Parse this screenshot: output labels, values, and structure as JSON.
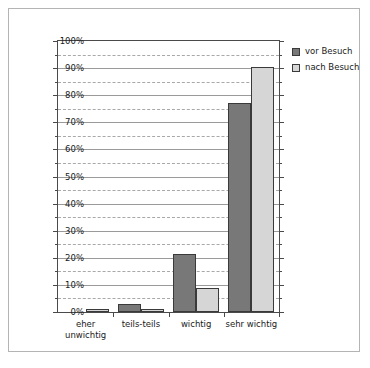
{
  "chart_data": {
    "type": "bar",
    "title": "",
    "xlabel": "",
    "ylabel": "",
    "ylim": [
      0,
      100
    ],
    "grid": true,
    "legend_position": "top-right",
    "categories": [
      "eher\nunwichtig",
      "teils-teils",
      "wichtig",
      "sehr wichtig"
    ],
    "series": [
      {
        "name": "vor Besuch",
        "color": "#787878",
        "values": [
          0,
          3,
          21.5,
          77
        ]
      },
      {
        "name": "nach Besuch",
        "color": "#d6d6d6",
        "values": [
          1,
          1,
          9,
          90.5
        ]
      }
    ],
    "y_ticks": [
      {
        "value": 0,
        "label": "0%"
      },
      {
        "value": 10,
        "label": "10%"
      },
      {
        "value": 20,
        "label": "20%"
      },
      {
        "value": 30,
        "label": "30%"
      },
      {
        "value": 40,
        "label": "40%"
      },
      {
        "value": 50,
        "label": "50%"
      },
      {
        "value": 60,
        "label": "60%"
      },
      {
        "value": 70,
        "label": "70%"
      },
      {
        "value": 80,
        "label": "80%"
      },
      {
        "value": 90,
        "label": "90%"
      },
      {
        "value": 100,
        "label": "100%"
      }
    ],
    "y_minor_ticks": [
      5,
      15,
      25,
      35,
      45,
      55,
      65,
      75,
      85,
      95
    ]
  },
  "legend": {
    "items": [
      {
        "label": "vor Besuch"
      },
      {
        "label": "nach Besuch"
      }
    ]
  }
}
